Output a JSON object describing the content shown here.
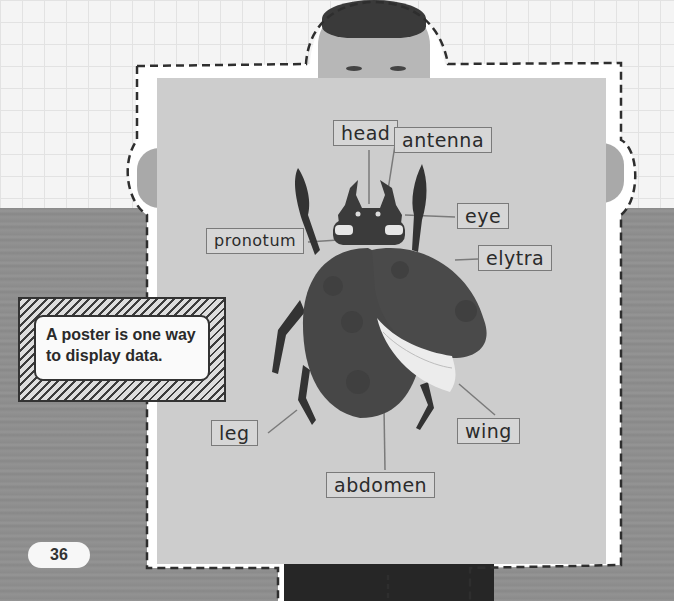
{
  "page": {
    "number": "36",
    "caption": "A poster is one way to display data."
  },
  "poster": {
    "subject": "beetle",
    "labels": {
      "head": "head",
      "antenna": "antenna",
      "eye": "eye",
      "pronotum": "pronotum",
      "elytra": "elytra",
      "leg": "leg",
      "wing": "wing",
      "abdomen": "abdomen"
    }
  },
  "colors": {
    "grid_background": "#f4f4f4",
    "table": "#8f8f8f",
    "poster": "#cdcdcd",
    "beetle_body": "#474747",
    "wing": "#ececec",
    "label_border": "#7a7a7a",
    "dashed_outline": "#2e2e2e"
  }
}
